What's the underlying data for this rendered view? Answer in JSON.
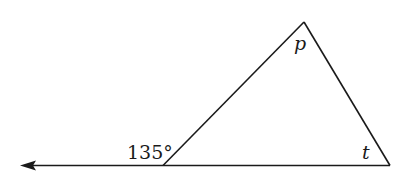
{
  "figure": {
    "type": "triangle-exterior-angle",
    "exterior_angle_label": "135°",
    "top_angle_label": "p",
    "right_angle_label": "t",
    "stroke_color": "#1a1a1a",
    "background_color": "#ffffff"
  }
}
